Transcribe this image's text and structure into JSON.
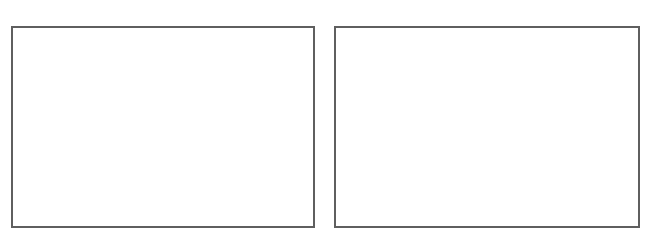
{
  "panels": [
    {
      "id": "left",
      "content": ""
    },
    {
      "id": "right",
      "content": ""
    }
  ],
  "colors": {
    "border": "#5f5f5f",
    "background": "#ffffff"
  }
}
